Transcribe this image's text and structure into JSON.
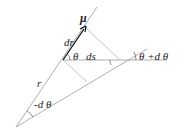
{
  "diagram": {
    "type": "geometry",
    "labels": {
      "mu": "μ",
      "dr": "dr",
      "theta": "θ",
      "ds": "ds",
      "theta_plus_dtheta": "θ +d θ",
      "r": "r",
      "minus_dtheta": "-d θ"
    },
    "colors": {
      "thin_line": "#9a9a9a",
      "construction_line": "#b5b5b5",
      "vector": "#111111",
      "text": "#222222"
    }
  }
}
